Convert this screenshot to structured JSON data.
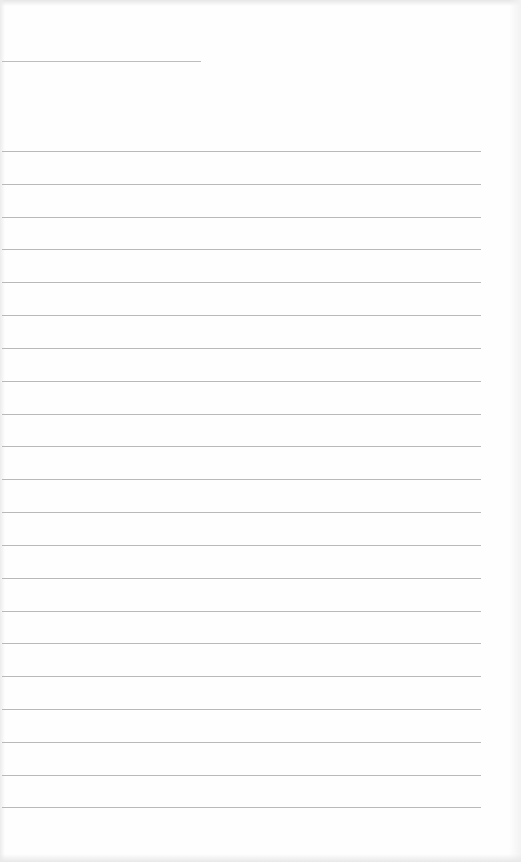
{
  "document": {
    "type": "blank lined paper",
    "header_line": {
      "x": 2,
      "y": 61,
      "width": 199
    },
    "ruled_lines": {
      "x": 2,
      "width": 479,
      "y_positions": [
        151,
        184,
        217,
        249,
        282,
        315,
        348,
        381,
        414,
        446,
        479,
        512,
        545,
        578,
        611,
        643,
        676,
        709,
        742,
        775,
        807
      ]
    },
    "colors": {
      "paper": "#fefefe",
      "rule": "#b9b9b9"
    }
  }
}
